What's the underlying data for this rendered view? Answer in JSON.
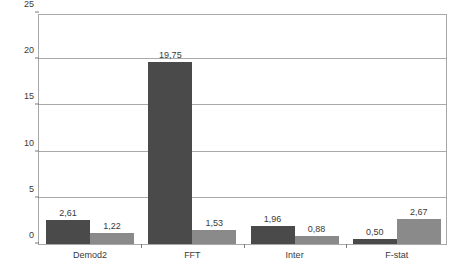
{
  "chart_data": {
    "type": "bar",
    "title": "",
    "subtitle": "",
    "xlabel": "",
    "ylabel": "",
    "categories": [
      "Demod2",
      "FFT",
      "Inter",
      "F-stat"
    ],
    "series": [
      {
        "name": "series-1",
        "color": "#4a4a4a",
        "values": [
          2.61,
          19.75,
          1.96,
          0.5
        ],
        "labels": [
          "2,61",
          "19,75",
          "1,96",
          "0,50"
        ]
      },
      {
        "name": "series-2",
        "color": "#8a8a8a",
        "values": [
          1.22,
          1.53,
          0.88,
          2.67
        ],
        "labels": [
          "1,22",
          "1,53",
          "0,88",
          "2,67"
        ]
      }
    ],
    "ylim": [
      0,
      25
    ],
    "yticks": [
      0,
      5,
      10,
      15,
      20,
      25
    ],
    "ytick_labels": [
      "0",
      "5",
      "10",
      "15",
      "20",
      "25"
    ],
    "grid": true,
    "grid_axis": "y",
    "legend": false,
    "legend_position": "none",
    "frame": true,
    "frame_color": "#a8a8a8",
    "background": "#ffffff",
    "decimal_separator": ","
  }
}
